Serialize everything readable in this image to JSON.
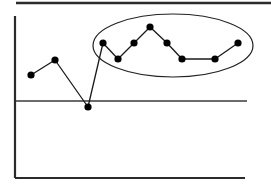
{
  "chart_data": {
    "type": "line",
    "title": "",
    "subtitle": "",
    "xlabel": "",
    "ylabel": "",
    "xlim": [
      0,
      12
    ],
    "ylim": [
      -1,
      5
    ],
    "grid": false,
    "legend_position": "none",
    "x": [
      1,
      2,
      3,
      4,
      5,
      6,
      7,
      8,
      9,
      10,
      11
    ],
    "series": [
      {
        "name": "series-1",
        "marker": "filled-circle",
        "values": [
          1.45,
          2.2,
          -0.3,
          3.0,
          2.2,
          3.0,
          3.8,
          3.0,
          2.2,
          2.2,
          3.0
        ]
      }
    ],
    "tick_labels": {
      "x": [],
      "y": []
    },
    "annotations": [
      {
        "name": "highlight-ellipse",
        "shape": "ellipse",
        "label": "",
        "encloses_x": [
          4,
          11
        ],
        "encloses_y": [
          2.2,
          3.8
        ],
        "stroke": "#222222",
        "fill": "none"
      },
      {
        "name": "baseline-reference-line",
        "shape": "horizontal-line",
        "label": "",
        "y_value": 0.0,
        "stroke": "#3a3a3a"
      }
    ]
  },
  "figure": {
    "background_color": "#ffffff",
    "line_color": "#1a1a1a",
    "marker_color": "#000000",
    "axis_color": "#2b2b2b",
    "annotation_color": "#222222",
    "top_rule_color": "#2b2b2b"
  },
  "geometry": {
    "top_rule": {
      "x1": 16,
      "y1": 3,
      "x2": 271,
      "y2": 3
    },
    "y_axis": {
      "x1": 15,
      "y1": 16,
      "x2": 15,
      "y2": 178
    },
    "x_axis": {
      "x1": 15,
      "y1": 178,
      "x2": 245,
      "y2": 178
    },
    "reference_line": {
      "x1": 16,
      "y1": 101,
      "x2": 247,
      "y2": 101
    },
    "ellipse": {
      "cx": 173,
      "cy": 45.5,
      "rx": 80,
      "ry": 31.5
    },
    "points": [
      {
        "x": 31,
        "y": 75
      },
      {
        "x": 55,
        "y": 60
      },
      {
        "x": 88,
        "y": 107
      },
      {
        "x": 103,
        "y": 43
      },
      {
        "x": 118,
        "y": 59
      },
      {
        "x": 134,
        "y": 43
      },
      {
        "x": 150,
        "y": 27
      },
      {
        "x": 167,
        "y": 43
      },
      {
        "x": 182,
        "y": 59
      },
      {
        "x": 215,
        "y": 59
      },
      {
        "x": 238,
        "y": 43
      }
    ],
    "marker_radius": 3.6
  }
}
